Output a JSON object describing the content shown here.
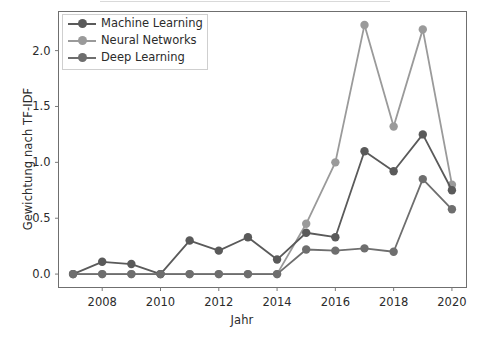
{
  "chart_data": {
    "type": "line",
    "title": "",
    "xlabel": "Jahr",
    "ylabel": "Gewichtung nach TF-IDF",
    "x": [
      2007,
      2008,
      2009,
      2010,
      2011,
      2012,
      2013,
      2014,
      2015,
      2016,
      2017,
      2018,
      2019,
      2020
    ],
    "xticks": [
      2008,
      2010,
      2012,
      2014,
      2016,
      2018,
      2020
    ],
    "xtick_labels": [
      "2008",
      "2010",
      "2012",
      "2014",
      "2016",
      "2018",
      "2020"
    ],
    "yticks": [
      0.0,
      0.5,
      1.0,
      1.5,
      2.0
    ],
    "ytick_labels": [
      "0.0",
      "0.5",
      "1.0",
      "1.5",
      "2.0"
    ],
    "xlim": [
      2006.5,
      2020.5
    ],
    "ylim": [
      -0.12,
      2.35
    ],
    "grid": false,
    "legend_position": "upper left",
    "series": [
      {
        "name": "Machine Learning",
        "color": "#5a5a5a",
        "values": [
          0.0,
          0.11,
          0.09,
          0.0,
          0.3,
          0.21,
          0.33,
          0.13,
          0.37,
          0.33,
          1.1,
          0.92,
          1.25,
          0.75
        ]
      },
      {
        "name": "Neural Networks",
        "color": "#9a9a9a",
        "values": [
          0.0,
          0.0,
          0.0,
          0.0,
          0.0,
          0.0,
          0.0,
          0.0,
          0.45,
          1.0,
          2.23,
          1.32,
          2.19,
          0.8
        ]
      },
      {
        "name": "Deep Learning",
        "color": "#6e6e6e",
        "values": [
          0.0,
          0.0,
          0.0,
          0.0,
          0.0,
          0.0,
          0.0,
          0.0,
          0.22,
          0.21,
          0.23,
          0.2,
          0.85,
          0.58
        ]
      }
    ]
  },
  "axes": {
    "xlabel": "Jahr",
    "ylabel": "Gewichtung nach TF-IDF"
  },
  "legend": {
    "items": [
      {
        "label": "Machine Learning"
      },
      {
        "label": "Neural Networks"
      },
      {
        "label": "Deep Learning"
      }
    ]
  },
  "colors": {
    "machine_learning": "#5a5a5a",
    "neural_networks": "#9a9a9a",
    "deep_learning": "#6e6e6e",
    "axis": "#7a7a7a",
    "text": "#2b2b2b",
    "background": "#ffffff"
  }
}
